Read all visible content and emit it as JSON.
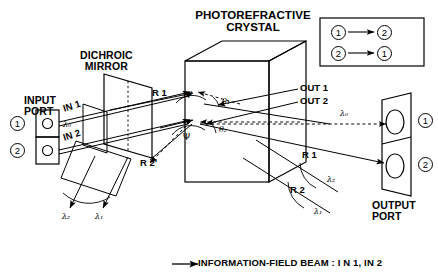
{
  "figure": {
    "title": "PHOTOREFRACTIVE CRYSTAL",
    "title_line1": "PHOTOREFRACTIVE",
    "title_line2": "CRYSTAL",
    "caption": "INFORMATION-FIELD  BEAM : I N 1, IN 2"
  },
  "input_port": {
    "label_line1": "INPUT",
    "label_line2": "PORT",
    "channel_1": "1",
    "channel_2": "2",
    "beam_in1": "IN 1",
    "beam_in2": "IN 2",
    "wavelength_in": "λ₀"
  },
  "mirror": {
    "label_line1": "DICHROIC",
    "label_line2": "MIRROR"
  },
  "output_port": {
    "label_line1": "OUTPUT",
    "label_line2": "PORT",
    "channel_1": "1",
    "channel_2": "2",
    "wavelength_out": "λ₀"
  },
  "beams": {
    "out1": "OUT 1",
    "out2": "OUT 2",
    "r1_left": "R 1",
    "r2p_left": "R 2'",
    "r1_right": "R 1",
    "r2_right": "R 2",
    "lambda_left_1": "λ₂",
    "lambda_left_2": "λ₁",
    "lambda_right_1": "λ₂",
    "lambda_right_2": "λ₁"
  },
  "angles": {
    "psi_upper": "Ψ",
    "psi_lower": "Ψ",
    "theta1": "θ₁",
    "theta2": "θ₂"
  },
  "legend": {
    "row1_from": "1",
    "row1_to": "2",
    "row2_from": "2",
    "row2_to": "1"
  },
  "colors": {
    "ink": "#000000",
    "paper": "#ffffff"
  }
}
